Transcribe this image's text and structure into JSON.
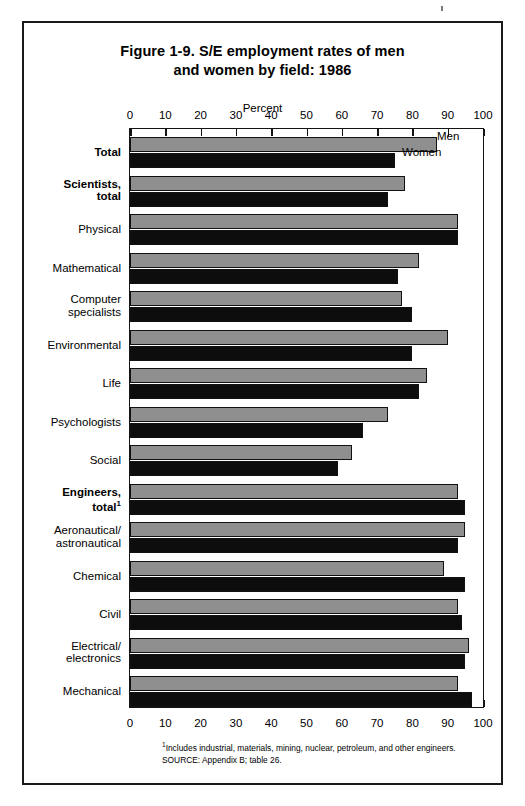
{
  "figure": {
    "title_line1": "Figure 1-9.  S/E employment rates of men",
    "title_line2": "and women by field:  1986",
    "axis_title": "Percent",
    "footnote": "Includes industrial, materials, mining, nuclear, petroleum, and other engineers.",
    "footnote_marker": "1",
    "source": "SOURCE:  Appendix B; table 26.",
    "series_men_label": "Men",
    "series_women_label": "Women",
    "colors": {
      "men_bar": "#8f8f8f",
      "women_bar": "#0d0d0d",
      "outline": "#111111",
      "frame": "#1a1a1a",
      "background": "#ffffff"
    }
  },
  "chart_data": {
    "type": "bar",
    "orientation": "horizontal",
    "title": "Figure 1-9.  S/E employment rates of men and women by field:  1986",
    "xlabel": "Percent",
    "ylabel": "",
    "xlim": [
      0,
      100
    ],
    "xticks": [
      0,
      10,
      20,
      30,
      40,
      50,
      60,
      70,
      80,
      90,
      100
    ],
    "xtick_labels": [
      "0",
      "10",
      "20",
      "30",
      "40",
      "50",
      "60",
      "70",
      "80",
      "90",
      "100"
    ],
    "grid": false,
    "legend": "inline-labels-on-first-group",
    "categories": [
      "Total",
      "Scientists, total",
      "Physical",
      "Mathematical",
      "Computer specialists",
      "Environmental",
      "Life",
      "Psychologists",
      "Social",
      "Engineers, total",
      "Aeronautical/ astronautical",
      "Chemical",
      "Civil",
      "Electrical/ electronics",
      "Mechanical"
    ],
    "category_labels": [
      {
        "lines": [
          "Total"
        ],
        "bold": true
      },
      {
        "lines": [
          "Scientists,",
          "total"
        ],
        "bold": true
      },
      {
        "lines": [
          "Physical"
        ],
        "bold": false
      },
      {
        "lines": [
          "Mathematical"
        ],
        "bold": false
      },
      {
        "lines": [
          "Computer",
          "specialists"
        ],
        "bold": false
      },
      {
        "lines": [
          "Environmental"
        ],
        "bold": false
      },
      {
        "lines": [
          "Life"
        ],
        "bold": false
      },
      {
        "lines": [
          "Psychologists"
        ],
        "bold": false
      },
      {
        "lines": [
          "Social"
        ],
        "bold": false
      },
      {
        "lines": [
          "Engineers,",
          "total"
        ],
        "bold": true,
        "superscript": "1"
      },
      {
        "lines": [
          "Aeronautical/",
          "astronautical"
        ],
        "bold": false
      },
      {
        "lines": [
          "Chemical"
        ],
        "bold": false
      },
      {
        "lines": [
          "Civil"
        ],
        "bold": false
      },
      {
        "lines": [
          "Electrical/",
          "electronics"
        ],
        "bold": false
      },
      {
        "lines": [
          "Mechanical"
        ],
        "bold": false
      }
    ],
    "series": [
      {
        "name": "Men",
        "color": "#8f8f8f",
        "values": [
          87,
          78,
          93,
          82,
          77,
          90,
          84,
          73,
          63,
          93,
          95,
          89,
          93,
          96,
          93
        ]
      },
      {
        "name": "Women",
        "color": "#0d0d0d",
        "values": [
          75,
          73,
          93,
          76,
          80,
          80,
          82,
          66,
          59,
          95,
          93,
          95,
          94,
          95,
          97
        ]
      }
    ]
  }
}
